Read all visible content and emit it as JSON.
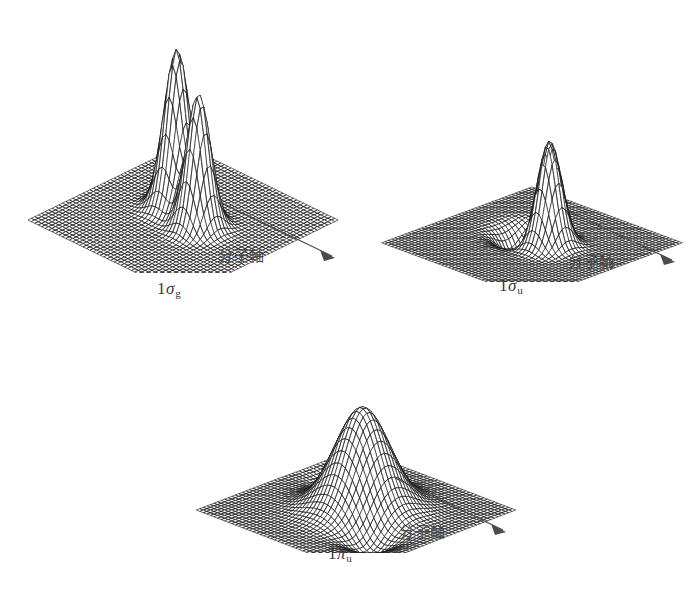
{
  "figure": {
    "background_color": "#ffffff",
    "ink_color": "#1b1b1b",
    "label_color": "#37383a",
    "annotation_color": "#4a4b4d",
    "width": 700,
    "height": 598
  },
  "panels": [
    {
      "id": "sigma-g",
      "label_number": "1",
      "label_symbol": "σ",
      "label_subscript": "g",
      "axis_annotation_text": "分子軸",
      "surface": {
        "kind": "two-peak-bonding",
        "description": "Two sharp symmetric peaks with a saddle between them, on a flat plane",
        "peaks": [
          {
            "u": 0.4,
            "v": 0.44,
            "amplitude": 1.0,
            "width": 0.085
          },
          {
            "u": 0.6,
            "v": 0.5,
            "amplitude": 0.84,
            "width": 0.08
          }
        ],
        "troughs": [],
        "grid_u": 46,
        "grid_v": 46
      }
    },
    {
      "id": "sigma-u",
      "label_number": "1",
      "label_symbol": "σ",
      "label_subscript": "u",
      "axis_annotation_text": "分子軸",
      "surface": {
        "kind": "peak-and-trough-antibonding",
        "description": "One sharp peak on the right and a matching depression on the left, antisymmetric about the node",
        "peaks": [
          {
            "u": 0.585,
            "v": 0.47,
            "amplitude": 0.92,
            "width": 0.085
          }
        ],
        "troughs": [
          {
            "u": 0.395,
            "v": 0.44,
            "amplitude": -0.46,
            "width": 0.11
          }
        ],
        "grid_u": 46,
        "grid_v": 46
      }
    },
    {
      "id": "pi-u",
      "label_number": "1",
      "label_symbol": "π",
      "label_subscript": "u",
      "axis_annotation_text": "分子軸",
      "surface": {
        "kind": "broad-hump-pi",
        "description": "Single broad central hump elongated along the molecular axis, with shallow depressions flanking it",
        "peaks": [
          {
            "u": 0.5,
            "v": 0.46,
            "amplitude": 0.78,
            "width": 0.175
          }
        ],
        "troughs": [
          {
            "u": 0.255,
            "v": 0.3,
            "amplitude": -0.16,
            "width": 0.13
          },
          {
            "u": 0.745,
            "v": 0.66,
            "amplitude": -0.16,
            "width": 0.13
          }
        ],
        "grid_u": 46,
        "grid_v": 46
      }
    }
  ]
}
